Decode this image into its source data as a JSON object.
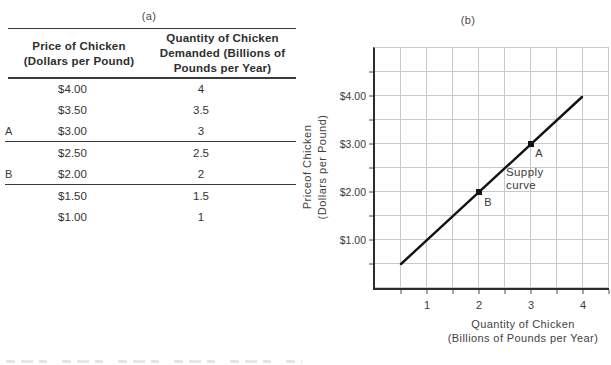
{
  "panel_a": {
    "label": "(a)",
    "table": {
      "col1_header_lines": [
        "Price of Chicken",
        "(Dollars per Pound)"
      ],
      "col2_header_lines": [
        "Quantity of Chicken",
        "Demanded (Billions of",
        "Pounds per Year)"
      ],
      "rows": [
        {
          "marker": "",
          "price": "$4.00",
          "quantity": "4"
        },
        {
          "marker": "",
          "price": "$3.50",
          "quantity": "3.5"
        },
        {
          "marker": "A",
          "price": "$3.00",
          "quantity": "3"
        },
        {
          "marker": "",
          "price": "$2.50",
          "quantity": "2.5"
        },
        {
          "marker": "B",
          "price": "$2.00",
          "quantity": "2"
        },
        {
          "marker": "",
          "price": "$1.50",
          "quantity": "1.5"
        },
        {
          "marker": "",
          "price": "$1.00",
          "quantity": "1"
        }
      ]
    }
  },
  "panel_b": {
    "label": "(b)",
    "chart": {
      "ylabel_lines": [
        "Priceof Chicken",
        "(Dollars per Pound)"
      ],
      "xlabel_lines": [
        "Quantity of Chicken",
        "(Billions of Pounds per Year)"
      ],
      "y_tick_labels": [
        "$4.00",
        "$3.00",
        "$2.00",
        "$1.00"
      ],
      "x_tick_labels": [
        "1",
        "2",
        "3",
        "4"
      ],
      "curve_label_lines": [
        "Supply",
        "curve"
      ],
      "point_labels": {
        "a": "A",
        "b": "B"
      }
    }
  },
  "colors": {
    "background": "#ffffff",
    "text": "#3a3a3a",
    "rules_and_axes": "#2c2c2c",
    "gridline": "#c9c9cc",
    "supply_line": "#121212"
  },
  "chart_data": [
    {
      "type": "table",
      "title": "(a)",
      "columns": [
        "Price of Chicken (Dollars per Pound)",
        "Quantity of Chicken Demanded (Billions of Pounds per Year)"
      ],
      "row_markers": [
        "",
        "",
        "A",
        "",
        "B",
        "",
        ""
      ],
      "rows": [
        [
          "$4.00",
          "4"
        ],
        [
          "$3.50",
          "3.5"
        ],
        [
          "$3.00",
          "3"
        ],
        [
          "$2.50",
          "2.5"
        ],
        [
          "$2.00",
          "2"
        ],
        [
          "$1.50",
          "1.5"
        ],
        [
          "$1.00",
          "1"
        ]
      ],
      "underlined_rows": [
        "A",
        "B"
      ]
    },
    {
      "type": "line",
      "title": "(b)",
      "series": [
        {
          "name": "Supply curve",
          "x": [
            0.5,
            1,
            1.5,
            2,
            2.5,
            3,
            3.5,
            4
          ],
          "y": [
            0.5,
            1,
            1.5,
            2,
            2.5,
            3,
            3.5,
            4
          ]
        }
      ],
      "marked_points": [
        {
          "label": "A",
          "x": 3,
          "y": 3
        },
        {
          "label": "B",
          "x": 2,
          "y": 2
        }
      ],
      "xlabel": "Quantity of Chicken (Billions of Pounds per Year)",
      "ylabel": "Priceof Chicken (Dollars per Pound)",
      "x_ticks": [
        1,
        2,
        3,
        4
      ],
      "y_tick_labels": [
        "$1.00",
        "$2.00",
        "$3.00",
        "$4.00"
      ],
      "xlim": [
        0,
        4.5
      ],
      "ylim": [
        0,
        5
      ],
      "grid": true,
      "grid_step": 0.5,
      "legend_position": "none"
    }
  ]
}
